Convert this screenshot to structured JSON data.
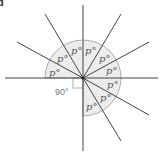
{
  "figure": {
    "corner_label": "d",
    "center": [
      83,
      78
    ],
    "arc_radius": 38,
    "colors": {
      "line": "#444444",
      "sector_fill": "#ececec",
      "sector_stroke": "#9a9a9a",
      "label": "#555555"
    },
    "rays_deg": [
      0,
      30,
      60,
      90,
      120,
      150,
      180,
      270,
      300,
      330
    ],
    "angle_label": "p°",
    "angle_count": 9,
    "right_angle_label": "90°"
  }
}
